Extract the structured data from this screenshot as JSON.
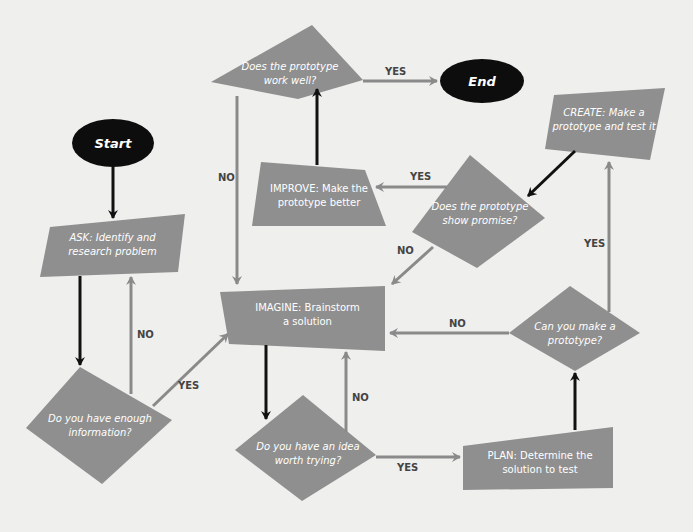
{
  "colors": {
    "background": "#efefed",
    "shape_fill": "#8f8f8f",
    "terminal_fill": "#0d0d0d",
    "arrow_black": "#111111",
    "arrow_grey": "#8a8a8a",
    "text": "#ffffff",
    "label": "#444444"
  },
  "nodes": {
    "start": {
      "label": "Start",
      "type": "terminal"
    },
    "end": {
      "label": "End",
      "type": "terminal"
    },
    "ask": {
      "line1": "ASK: Identify and",
      "line2": "research problem",
      "type": "process"
    },
    "enough_info": {
      "line1": "Do you have enough",
      "line2": "information?",
      "type": "decision"
    },
    "imagine": {
      "line1": "IMAGINE: Brainstorm",
      "line2": "a solution",
      "type": "process"
    },
    "idea_worth": {
      "line1": "Do you have an idea",
      "line2": "worth trying?",
      "type": "decision"
    },
    "plan": {
      "line1": "PLAN: Determine the",
      "line2": "solution to test",
      "type": "process"
    },
    "can_make": {
      "line1": "Can you make a",
      "line2": "prototype?",
      "type": "decision"
    },
    "create": {
      "line1": "CREATE: Make a",
      "line2": "prototype and test it",
      "type": "process"
    },
    "show_promise": {
      "line1": "Does the prototype",
      "line2": "show promise?",
      "type": "decision"
    },
    "improve": {
      "line1": "IMPROVE: Make the",
      "line2": "prototype better",
      "type": "process"
    },
    "works_well": {
      "line1": "Does the prototype",
      "line2": "work well?",
      "type": "decision"
    }
  },
  "edges": [
    {
      "from": "start",
      "to": "ask",
      "label": "",
      "style": "black"
    },
    {
      "from": "ask",
      "to": "enough_info",
      "label": "",
      "style": "black"
    },
    {
      "from": "enough_info",
      "to": "ask",
      "label": "NO",
      "style": "grey"
    },
    {
      "from": "enough_info",
      "to": "imagine",
      "label": "YES",
      "style": "grey"
    },
    {
      "from": "imagine",
      "to": "idea_worth",
      "label": "",
      "style": "black"
    },
    {
      "from": "idea_worth",
      "to": "imagine",
      "label": "NO",
      "style": "grey"
    },
    {
      "from": "idea_worth",
      "to": "plan",
      "label": "YES",
      "style": "grey"
    },
    {
      "from": "plan",
      "to": "can_make",
      "label": "",
      "style": "black"
    },
    {
      "from": "can_make",
      "to": "imagine",
      "label": "NO",
      "style": "grey"
    },
    {
      "from": "can_make",
      "to": "create",
      "label": "YES",
      "style": "grey"
    },
    {
      "from": "create",
      "to": "show_promise",
      "label": "",
      "style": "black"
    },
    {
      "from": "show_promise",
      "to": "imagine",
      "label": "NO",
      "style": "grey"
    },
    {
      "from": "show_promise",
      "to": "improve",
      "label": "YES",
      "style": "grey"
    },
    {
      "from": "improve",
      "to": "works_well",
      "label": "",
      "style": "black"
    },
    {
      "from": "works_well",
      "to": "imagine",
      "label": "NO",
      "style": "grey"
    },
    {
      "from": "works_well",
      "to": "end",
      "label": "YES",
      "style": "grey"
    }
  ],
  "labels": {
    "enough_no": "NO",
    "enough_yes": "YES",
    "idea_no": "NO",
    "idea_yes": "YES",
    "canmake_no": "NO",
    "canmake_yes": "YES",
    "promise_no": "NO",
    "promise_yes": "YES",
    "works_no": "NO",
    "works_yes": "YES"
  }
}
